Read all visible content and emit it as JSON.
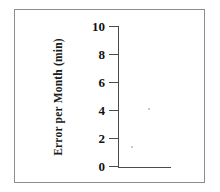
{
  "figure": {
    "width": 220,
    "height": 192,
    "background_color": "#ffffff",
    "frame_border_color": "#8d8d8d",
    "axis_color": "#4a4a4a",
    "text_color": "#111111"
  },
  "chart_data": {
    "type": "line",
    "title": "",
    "subtitle": "",
    "xlabel": "",
    "ylabel": "Error per Month (min)",
    "ylim": [
      0,
      10
    ],
    "ytick_values": [
      0,
      2,
      4,
      6,
      8,
      10
    ],
    "ytick_labels": [
      "0",
      "2",
      "4",
      "6",
      "8",
      "10"
    ],
    "xtick_values": [],
    "xtick_labels": [],
    "grid": false,
    "legend": null,
    "legend_position": "none",
    "annotations": [],
    "series": [],
    "note": "Empty axes template: y-axis scaled 0 to 10 with ticks every 2 units and a short horizontal baseline; no data series plotted."
  },
  "axes": {
    "y_axis": {
      "name": "Error per Month (min)",
      "min": 0,
      "max": 10,
      "tick_step": 2,
      "tick_direction": "outward-left"
    },
    "x_axis": {
      "name": "",
      "ticks": [],
      "baseline_only": true
    }
  }
}
